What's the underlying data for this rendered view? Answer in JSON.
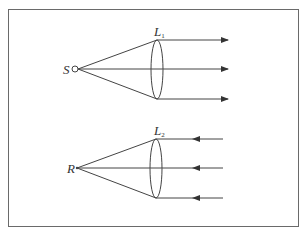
{
  "diagram": {
    "type": "optics-lens-ray-diagram",
    "top_panel": {
      "source_label": "S",
      "lens_label": "L",
      "lens_subscript": "1",
      "description": "Point source S emits diverging rays through convex lens L1, producing parallel rays traveling right",
      "ray_direction": "right"
    },
    "bottom_panel": {
      "point_label": "R",
      "lens_label": "L",
      "lens_subscript": "2",
      "description": "Parallel rays traveling left pass through convex lens L2 and converge to point R",
      "ray_direction": "left"
    },
    "colors": {
      "line": "#444444",
      "border": "#6a6a6a",
      "background": "#ffffff"
    }
  }
}
